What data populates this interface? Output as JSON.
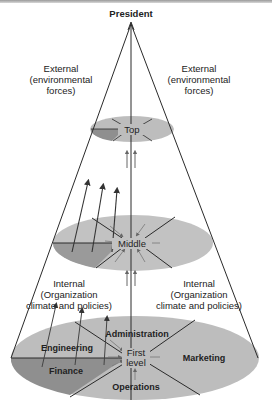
{
  "diagram": {
    "apex_label": "President",
    "external_left": [
      "External",
      "(environmental",
      "forces)"
    ],
    "external_right": [
      "External",
      "(environmental",
      "forces)"
    ],
    "internal_left": [
      "Internal",
      "(Organization",
      "climate and policies)"
    ],
    "internal_right": [
      "Internal",
      "(Organization",
      "climate and policies)"
    ],
    "levels": {
      "top": "Top",
      "middle": "Middle",
      "first": [
        "First",
        "level"
      ]
    },
    "departments": {
      "administration": "Administration",
      "engineering": "Engineering",
      "finance": "Finance",
      "operations": "Operations",
      "marketing": "Marketing"
    },
    "colors": {
      "ellipse_light": "#bdbdbd",
      "ellipse_dark": "#8f8f8f",
      "line": "#2a2a2a"
    }
  }
}
